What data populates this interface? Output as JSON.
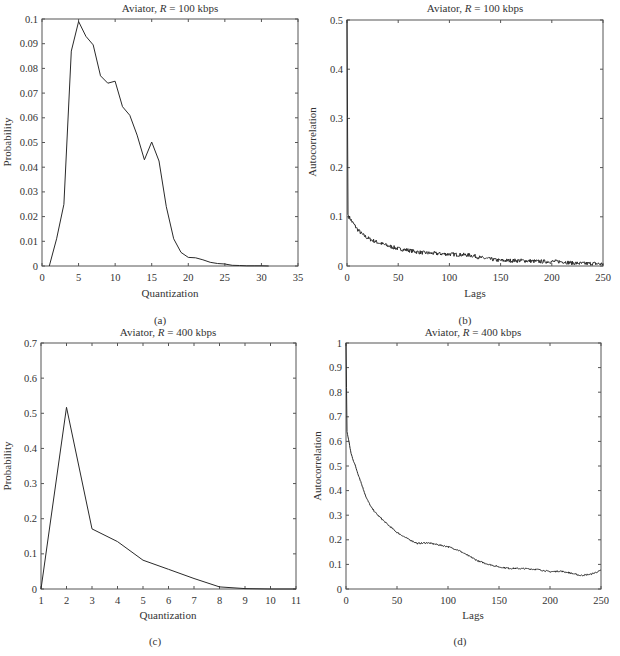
{
  "figure": {
    "panels": [
      {
        "id": "a",
        "caption": "(a)",
        "title_prefix": "Aviator, ",
        "title_var": "R",
        "title_suffix": " = 100 kbps",
        "xlabel": "Quantization",
        "ylabel": "Probability"
      },
      {
        "id": "b",
        "caption": "(b)",
        "title_prefix": "Aviator, ",
        "title_var": "R",
        "title_suffix": " = 100 kbps",
        "xlabel": "Lags",
        "ylabel": "Autocorrelation"
      },
      {
        "id": "c",
        "caption": "(c)",
        "title_prefix": "Aviator, ",
        "title_var": "R",
        "title_suffix": " = 400 kbps",
        "xlabel": "Quantization",
        "ylabel": "Probability"
      },
      {
        "id": "d",
        "caption": "(d)",
        "title_prefix": "Aviator, ",
        "title_var": "R",
        "title_suffix": " = 400 kbps",
        "xlabel": "Lags",
        "ylabel": "Autocorrelation"
      }
    ]
  },
  "chart_data": [
    {
      "type": "line",
      "title": "Aviator, R = 100 kbps",
      "xlabel": "Quantization",
      "ylabel": "Probability",
      "xlim": [
        0,
        35
      ],
      "ylim": [
        0,
        0.1
      ],
      "xticks": [
        0,
        5,
        10,
        15,
        20,
        25,
        30,
        35
      ],
      "yticks": [
        0,
        0.01,
        0.02,
        0.03,
        0.04,
        0.05,
        0.06,
        0.07,
        0.08,
        0.09,
        0.1
      ],
      "ytick_labels": [
        "0",
        "0.01",
        "0.02",
        "0.03",
        "0.04",
        "0.05",
        "0.06",
        "0.07",
        "0.08",
        "0.09",
        "0.1"
      ],
      "grid": false,
      "x": [
        1,
        2,
        3,
        4,
        5,
        6,
        7,
        8,
        9,
        10,
        11,
        12,
        13,
        14,
        15,
        16,
        17,
        18,
        19,
        20,
        21,
        22,
        23,
        24,
        25,
        26,
        27,
        28,
        29,
        30,
        31
      ],
      "values": [
        0,
        0.011,
        0.025,
        0.087,
        0.099,
        0.093,
        0.0895,
        0.077,
        0.074,
        0.0748,
        0.0645,
        0.061,
        0.053,
        0.043,
        0.0502,
        0.0425,
        0.024,
        0.011,
        0.0055,
        0.0035,
        0.0033,
        0.0025,
        0.0015,
        0.001,
        0.0008,
        0.0003,
        0.0002,
        0.0001,
        0.0001,
        0.0001,
        0
      ]
    },
    {
      "type": "line",
      "title": "Aviator, R = 100 kbps",
      "xlabel": "Lags",
      "ylabel": "Autocorrelation",
      "xlim": [
        0,
        250
      ],
      "ylim": [
        0,
        0.5
      ],
      "xticks": [
        0,
        50,
        100,
        150,
        200,
        250
      ],
      "yticks": [
        0,
        0.1,
        0.2,
        0.3,
        0.4,
        0.5
      ],
      "ytick_labels": [
        "0",
        "0.1",
        "0.2",
        "0.3",
        "0.4",
        "0.5"
      ],
      "grid": false,
      "x": [
        0,
        1,
        2,
        5,
        10,
        15,
        20,
        25,
        30,
        40,
        50,
        60,
        70,
        80,
        90,
        100,
        110,
        120,
        125,
        130,
        140,
        150,
        160,
        170,
        180,
        190,
        200,
        210,
        220,
        230,
        240,
        250
      ],
      "values": [
        0.5,
        0.105,
        0.1,
        0.09,
        0.075,
        0.064,
        0.057,
        0.052,
        0.048,
        0.041,
        0.035,
        0.032,
        0.028,
        0.026,
        0.025,
        0.024,
        0.023,
        0.022,
        0.02,
        0.017,
        0.014,
        0.011,
        0.011,
        0.011,
        0.01,
        0.009,
        0.009,
        0.009,
        0.006,
        0.005,
        0.005,
        0.004
      ],
      "noise_amplitude": 0.004
    },
    {
      "type": "line",
      "title": "Aviator, R = 400 kbps",
      "xlabel": "Quantization",
      "ylabel": "Probability",
      "xlim": [
        1,
        11
      ],
      "ylim": [
        0,
        0.7
      ],
      "xticks": [
        1,
        2,
        3,
        4,
        5,
        6,
        7,
        8,
        9,
        10,
        11
      ],
      "yticks": [
        0,
        0.1,
        0.2,
        0.3,
        0.4,
        0.5,
        0.6,
        0.7
      ],
      "ytick_labels": [
        "0",
        "0.1",
        "0.2",
        "0.3",
        "0.4",
        "0.5",
        "0.6",
        "0.7"
      ],
      "grid": false,
      "x": [
        1,
        2,
        3,
        4,
        5,
        6,
        7,
        8,
        9,
        10,
        11
      ],
      "values": [
        0,
        0.517,
        0.171,
        0.135,
        0.082,
        0.056,
        0.03,
        0.006,
        0.001,
        0,
        0
      ]
    },
    {
      "type": "line",
      "title": "Aviator, R = 400 kbps",
      "xlabel": "Lags",
      "ylabel": "Autocorrelation",
      "xlim": [
        0,
        250
      ],
      "ylim": [
        0,
        1
      ],
      "xticks": [
        0,
        50,
        100,
        150,
        200,
        250
      ],
      "yticks": [
        0,
        0.1,
        0.2,
        0.3,
        0.4,
        0.5,
        0.6,
        0.7,
        0.8,
        0.9,
        1
      ],
      "ytick_labels": [
        "0",
        "0.1",
        "0.2",
        "0.3",
        "0.4",
        "0.5",
        "0.6",
        "0.7",
        "0.8",
        "0.9",
        "1"
      ],
      "grid": false,
      "x": [
        0,
        1,
        5,
        10,
        15,
        20,
        25,
        30,
        40,
        50,
        60,
        70,
        80,
        90,
        100,
        110,
        120,
        130,
        140,
        150,
        160,
        170,
        180,
        190,
        200,
        210,
        220,
        230,
        240,
        250
      ],
      "values": [
        1.0,
        0.64,
        0.55,
        0.49,
        0.43,
        0.37,
        0.33,
        0.305,
        0.265,
        0.23,
        0.205,
        0.185,
        0.188,
        0.18,
        0.172,
        0.158,
        0.135,
        0.113,
        0.1,
        0.09,
        0.084,
        0.083,
        0.082,
        0.078,
        0.07,
        0.073,
        0.065,
        0.055,
        0.06,
        0.075
      ],
      "noise_amplitude": 0.003
    }
  ]
}
